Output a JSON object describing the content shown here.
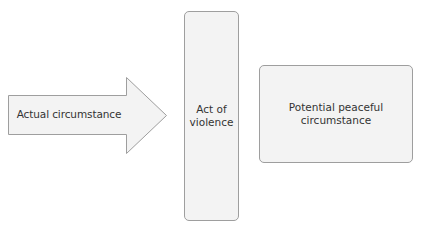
{
  "diagram": {
    "type": "flow",
    "colors": {
      "shape_fill": "#f3f3f3",
      "shape_border": "#9e9e9e",
      "text": "#333333",
      "background": "#ffffff"
    },
    "nodes": [
      {
        "id": "actual",
        "shape": "right-arrow",
        "label": "Actual circumstance"
      },
      {
        "id": "violence",
        "shape": "rounded-rectangle",
        "label_line1": "Act of",
        "label_line2": "violence"
      },
      {
        "id": "peaceful",
        "shape": "rounded-rectangle",
        "label_line1": "Potential peaceful",
        "label_line2": "circumstance"
      }
    ],
    "edges": [
      {
        "from": "actual",
        "to": "violence"
      }
    ]
  }
}
